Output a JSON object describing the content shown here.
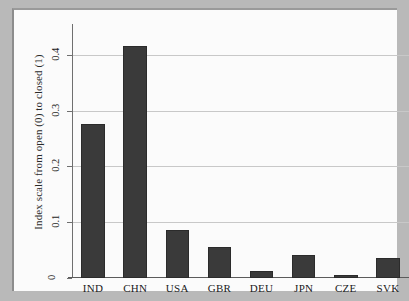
{
  "chart_data": {
    "type": "bar",
    "title": "",
    "subtitle": "",
    "xlabel": "",
    "ylabel": "Index scale from open (0) to closed (1)",
    "categories": [
      "IND",
      "CHN",
      "USA",
      "GBR",
      "DEU",
      "JPN",
      "CZE",
      "SVK"
    ],
    "values": [
      0.276,
      0.415,
      0.086,
      0.055,
      0.013,
      0.041,
      0.005,
      0.036
    ],
    "series": [
      {
        "name": "Index scale from open (0) to closed (1)",
        "values": [
          0.276,
          0.415,
          0.086,
          0.055,
          0.013,
          0.041,
          0.005,
          0.036
        ]
      }
    ],
    "ylim": [
      0,
      0.455
    ],
    "xlim": [
      0,
      8
    ],
    "y_ticks": [
      0,
      0.1,
      0.2,
      0.3,
      0.4
    ],
    "y_tick_labels": [
      "0",
      "0.1",
      "0.2",
      "0.3",
      "0.4"
    ],
    "grid": "horizontal",
    "legend": "none",
    "bar_color": "#3a3a3a",
    "plot_background": "#fbfbfb",
    "figure_background": "#b9b9b9",
    "gridline_color": "#c8c8c8",
    "axis_color": "#5b5b5b"
  },
  "axis": {
    "y_title": "Index scale from open (0) to closed (1)",
    "y_ticks": [
      {
        "label": "0",
        "value": 0
      },
      {
        "label": "0.1",
        "value": 0.1
      },
      {
        "label": "0.2",
        "value": 0.2
      },
      {
        "label": "0.3",
        "value": 0.3
      },
      {
        "label": "0.4",
        "value": 0.4
      }
    ],
    "x_ticks": [
      {
        "label": "IND"
      },
      {
        "label": "CHN"
      },
      {
        "label": "USA"
      },
      {
        "label": "GBR"
      },
      {
        "label": "DEU"
      },
      {
        "label": "JPN"
      },
      {
        "label": "CZE"
      },
      {
        "label": "SVK"
      }
    ]
  }
}
